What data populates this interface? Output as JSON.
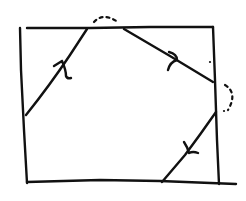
{
  "diagram": {
    "type": "hand-drawn rectangle with reflected path",
    "colors": {
      "ink": "#111111",
      "background": "#ffffff"
    },
    "rectangle": {
      "left_edge": [
        [
          20,
          28
        ],
        [
          27,
          183
        ]
      ],
      "top_edge": [
        [
          27,
          28
        ],
        [
          213,
          27
        ]
      ],
      "right_edge": [
        [
          213,
          27
        ],
        [
          219,
          184
        ]
      ],
      "bottom_edge": [
        [
          27,
          182
        ],
        [
          236,
          184
        ]
      ]
    },
    "path_segments": [
      {
        "id": "segment-1",
        "from": [
          26,
          115
        ],
        "to": [
          87,
          29
        ],
        "arrow_at": [
          63,
          62
        ],
        "direction": "up-right"
      },
      {
        "id": "segment-2",
        "from": [
          124,
          29
        ],
        "to": [
          213,
          82
        ],
        "arrow_at": [
          173,
          58
        ],
        "direction": "down-right"
      },
      {
        "id": "segment-3",
        "from": [
          216,
          112
        ],
        "to": [
          162,
          182
        ],
        "arrow_at": [
          190,
          152
        ],
        "direction": "down-left"
      }
    ],
    "dashed_jumps": [
      {
        "id": "jump-top",
        "points": [
          [
            94,
            22
          ],
          [
            103,
            15
          ],
          [
            118,
            22
          ]
        ]
      },
      {
        "id": "jump-right",
        "points": [
          [
            225,
            85
          ],
          [
            234,
            93
          ],
          [
            228,
            110
          ]
        ]
      }
    ],
    "stray_marks": [
      [
        210,
        62
      ],
      [
        224,
        111
      ]
    ]
  }
}
